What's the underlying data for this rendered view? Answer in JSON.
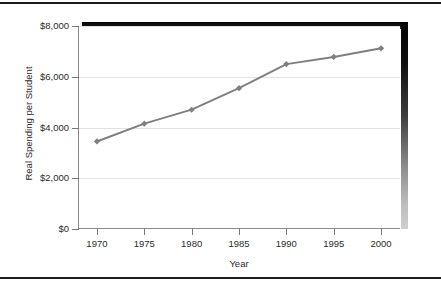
{
  "chart_data": {
    "type": "line",
    "title": "",
    "xlabel": "Year",
    "ylabel": "Real Spending per Student",
    "x": [
      1970,
      1975,
      1980,
      1985,
      1990,
      1995,
      2000
    ],
    "categories": [
      "1970",
      "1975",
      "1980",
      "1985",
      "1990",
      "1995",
      "2000"
    ],
    "values": [
      3450,
      4150,
      4700,
      5550,
      6500,
      6780,
      7120
    ],
    "series": [
      {
        "name": "Real Spending per Student",
        "values": [
          3450,
          4150,
          4700,
          5550,
          6500,
          6780,
          7120
        ]
      }
    ],
    "xlim": [
      1968,
      2002
    ],
    "ylim": [
      0,
      8000
    ],
    "ytick_values": [
      0,
      2000,
      4000,
      6000,
      8000
    ],
    "ytick_labels": [
      "$0",
      "$2,000",
      "$4,000",
      "$6,000",
      "$8,000"
    ],
    "xtick_labels": [
      "1970",
      "1975",
      "1980",
      "1985",
      "1990",
      "1995",
      "2000"
    ],
    "grid": "horizontal",
    "legend": "none",
    "line_color": "#7f7f7f",
    "marker": "diamond",
    "marker_color": "#7f7f7f",
    "gridline_color": "#e2e2e2",
    "axis_color": "#8a8a8a",
    "text_color": "#2b2b2b",
    "background_color": "#ffffff",
    "shadow_color": "#0a0a0a"
  }
}
